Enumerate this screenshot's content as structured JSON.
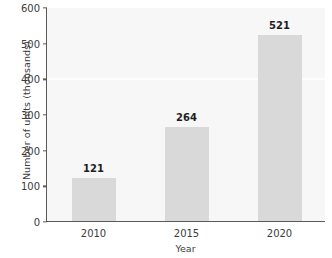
{
  "chart_data": {
    "type": "bar",
    "title": "",
    "categories": [
      "2010",
      "2015",
      "2020"
    ],
    "values": [
      121,
      264,
      521
    ],
    "data_labels": [
      "121",
      "264",
      "521"
    ],
    "xlabel": "Year",
    "ylabel": "Number of units (thousands)",
    "ylim": [
      0,
      600
    ],
    "yticks": [
      600,
      500,
      400,
      300,
      200,
      100,
      0
    ],
    "ytick_labels": [
      "600",
      "500",
      "400",
      "300",
      "200",
      "100",
      "0"
    ],
    "grid": false,
    "legend": null,
    "bar_color": "#d9d9da",
    "plot_background": "#f7f7f7",
    "axis_color": "#5a5a5a",
    "text_color": "#3c3c3c",
    "label_color": "#1e1e1e"
  }
}
